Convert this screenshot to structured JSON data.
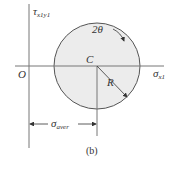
{
  "figure": {
    "caption": "(b)",
    "y_axis_label": "τ",
    "y_axis_subscript": "x1y1",
    "x_axis_label": "σ",
    "x_axis_subscript": "x1",
    "origin_label": "O",
    "center_label": "C",
    "radius_label": "R",
    "angle_label": "2θ",
    "dimension_label": "σ",
    "dimension_subscript": "aver",
    "circle_fill": "#ececec",
    "line_color": "#555555"
  }
}
